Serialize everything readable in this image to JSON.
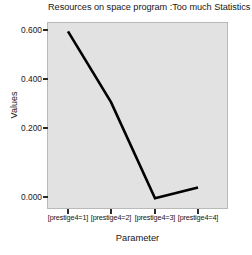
{
  "chart_data": {
    "type": "line",
    "title": "Resources on space program :Too much Statistics : B",
    "xlabel": "Parameter",
    "ylabel": "Values",
    "categories": [
      "[prestige4=1]",
      "[prestige4=2]",
      "[prestige4=3]",
      "[prestige4=4]"
    ],
    "values": [
      0.6,
      0.335,
      -0.025,
      0.015
    ],
    "series": [
      {
        "name": "Values",
        "values": [
          0.6,
          0.335,
          -0.025,
          0.015
        ]
      }
    ],
    "ytick_labels": [
      "0.000",
      "0.200",
      "0.400",
      "0.600"
    ],
    "ytick_values": [
      0.0,
      0.2,
      0.4,
      0.6
    ],
    "ylim": [
      -0.065,
      0.635
    ],
    "grid": false,
    "legend": "none",
    "line_color": "#000000",
    "panel_color": "#e2e2e2",
    "markers": "none"
  }
}
